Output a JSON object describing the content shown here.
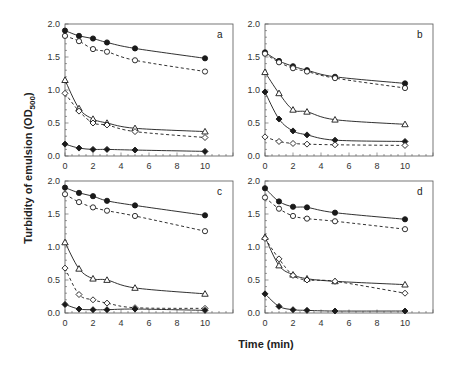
{
  "figure": {
    "xlabel": "Time (min)",
    "ylabel_main": "Turbidity of emulsion (OD",
    "ylabel_sub": "500",
    "ylabel_close": ")"
  },
  "chart_data": [
    {
      "type": "line",
      "panel": "a",
      "x": [
        0,
        1,
        2,
        3,
        5,
        10
      ],
      "xlabel": "Time (min)",
      "ylabel": "Turbidity of emulsion (OD500)",
      "xlim": [
        0,
        12
      ],
      "ylim": [
        0,
        2.0
      ],
      "xticks": [
        0,
        2,
        4,
        6,
        8,
        10
      ],
      "yticks": [
        0.0,
        0.5,
        1.0,
        1.5,
        2.0
      ],
      "series": [
        {
          "name": "filled-circle",
          "marker": "filled-circle",
          "line": "solid",
          "values": [
            1.9,
            1.82,
            1.78,
            1.72,
            1.63,
            1.48
          ]
        },
        {
          "name": "open-circle",
          "marker": "open-circle",
          "line": "dashed",
          "values": [
            1.82,
            1.74,
            1.62,
            1.58,
            1.45,
            1.28
          ]
        },
        {
          "name": "open-triangle",
          "marker": "open-triangle",
          "line": "solid",
          "values": [
            1.15,
            0.72,
            0.56,
            0.5,
            0.42,
            0.37
          ]
        },
        {
          "name": "open-diamond",
          "marker": "open-diamond",
          "line": "dashed",
          "values": [
            0.95,
            0.68,
            0.5,
            0.47,
            0.37,
            0.28
          ]
        },
        {
          "name": "filled-diamond",
          "marker": "filled-diamond",
          "line": "solid",
          "values": [
            0.18,
            0.12,
            0.1,
            0.1,
            0.09,
            0.07
          ]
        }
      ]
    },
    {
      "type": "line",
      "panel": "b",
      "x": [
        0,
        1,
        2,
        3,
        5,
        10
      ],
      "xlim": [
        0,
        12
      ],
      "ylim": [
        0,
        2.0
      ],
      "xticks": [
        0,
        2,
        4,
        6,
        8,
        10
      ],
      "yticks": [
        0.0,
        0.5,
        1.0,
        1.5,
        2.0
      ],
      "series": [
        {
          "name": "filled-circle",
          "marker": "filled-circle",
          "line": "solid",
          "values": [
            1.57,
            1.44,
            1.36,
            1.3,
            1.2,
            1.1
          ]
        },
        {
          "name": "open-circle",
          "marker": "open-circle",
          "line": "dashed",
          "values": [
            1.55,
            1.42,
            1.33,
            1.28,
            1.18,
            1.03
          ]
        },
        {
          "name": "open-triangle",
          "marker": "open-triangle",
          "line": "solid",
          "values": [
            1.27,
            0.95,
            0.7,
            0.67,
            0.55,
            0.48
          ]
        },
        {
          "name": "filled-diamond",
          "marker": "filled-diamond",
          "line": "solid",
          "values": [
            0.97,
            0.56,
            0.38,
            0.32,
            0.24,
            0.22
          ]
        },
        {
          "name": "open-diamond",
          "marker": "open-diamond",
          "line": "dashed",
          "values": [
            0.29,
            0.22,
            0.19,
            0.18,
            0.17,
            0.16
          ]
        }
      ]
    },
    {
      "type": "line",
      "panel": "c",
      "x": [
        0,
        1,
        2,
        3,
        5,
        10
      ],
      "xlim": [
        0,
        12
      ],
      "ylim": [
        0,
        2.0
      ],
      "xticks": [
        0,
        2,
        4,
        6,
        8,
        10
      ],
      "yticks": [
        0.0,
        0.5,
        1.0,
        1.5,
        2.0
      ],
      "series": [
        {
          "name": "filled-circle",
          "marker": "filled-circle",
          "line": "solid",
          "values": [
            1.9,
            1.82,
            1.77,
            1.7,
            1.63,
            1.48
          ]
        },
        {
          "name": "open-circle",
          "marker": "open-circle",
          "line": "dashed",
          "values": [
            1.8,
            1.68,
            1.6,
            1.55,
            1.47,
            1.24
          ]
        },
        {
          "name": "open-triangle",
          "marker": "open-triangle",
          "line": "solid",
          "values": [
            1.07,
            0.67,
            0.52,
            0.5,
            0.38,
            0.29
          ]
        },
        {
          "name": "open-diamond",
          "marker": "open-diamond",
          "line": "dashed",
          "values": [
            0.68,
            0.28,
            0.2,
            0.15,
            0.08,
            0.07
          ]
        },
        {
          "name": "filled-diamond",
          "marker": "filled-diamond",
          "line": "solid",
          "values": [
            0.13,
            0.06,
            0.05,
            0.05,
            0.06,
            0.04
          ]
        }
      ]
    },
    {
      "type": "line",
      "panel": "d",
      "x": [
        0,
        1,
        2,
        3,
        5,
        10
      ],
      "xlim": [
        0,
        12
      ],
      "ylim": [
        0,
        2.0
      ],
      "xticks": [
        0,
        2,
        4,
        6,
        8,
        10
      ],
      "yticks": [
        0.0,
        0.5,
        1.0,
        1.5,
        2.0
      ],
      "series": [
        {
          "name": "filled-circle",
          "marker": "filled-circle",
          "line": "solid",
          "values": [
            1.89,
            1.69,
            1.61,
            1.6,
            1.52,
            1.42
          ]
        },
        {
          "name": "open-circle",
          "marker": "open-circle",
          "line": "dashed",
          "values": [
            1.75,
            1.58,
            1.47,
            1.43,
            1.39,
            1.27
          ]
        },
        {
          "name": "open-triangle",
          "marker": "open-triangle",
          "line": "solid",
          "values": [
            1.15,
            0.72,
            0.58,
            0.52,
            0.48,
            0.43
          ]
        },
        {
          "name": "open-diamond",
          "marker": "open-diamond",
          "line": "dashed",
          "values": [
            1.13,
            0.82,
            0.57,
            0.5,
            0.48,
            0.3
          ]
        },
        {
          "name": "filled-diamond",
          "marker": "filled-diamond",
          "line": "solid",
          "values": [
            0.29,
            0.1,
            0.05,
            0.04,
            0.03,
            0.03
          ]
        }
      ]
    }
  ],
  "layout": {
    "panels": [
      {
        "left": 65,
        "top": 24,
        "right": 233,
        "bottom": 156
      },
      {
        "left": 265,
        "top": 24,
        "right": 433,
        "bottom": 156
      },
      {
        "left": 65,
        "top": 181,
        "right": 233,
        "bottom": 313
      },
      {
        "left": 265,
        "top": 181,
        "right": 433,
        "bottom": 313
      }
    ]
  }
}
